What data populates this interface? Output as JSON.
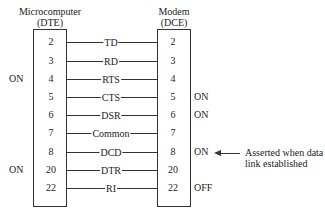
{
  "left_device": {
    "name": "Microcomputer",
    "type": "(DTE)"
  },
  "right_device": {
    "name": "Modem",
    "type": "(DCE)"
  },
  "connections": [
    {
      "left_pin": "2",
      "signal": "TD",
      "right_pin": "2",
      "left_state": "",
      "right_state": ""
    },
    {
      "left_pin": "3",
      "signal": "RD",
      "right_pin": "3",
      "left_state": "",
      "right_state": ""
    },
    {
      "left_pin": "4",
      "signal": "RTS",
      "right_pin": "4",
      "left_state": "ON",
      "right_state": ""
    },
    {
      "left_pin": "5",
      "signal": "CTS",
      "right_pin": "5",
      "left_state": "",
      "right_state": "ON"
    },
    {
      "left_pin": "6",
      "signal": "DSR",
      "right_pin": "6",
      "left_state": "",
      "right_state": "ON"
    },
    {
      "left_pin": "7",
      "signal": "Common",
      "right_pin": "7",
      "left_state": "",
      "right_state": ""
    },
    {
      "left_pin": "8",
      "signal": "DCD",
      "right_pin": "8",
      "left_state": "",
      "right_state": "ON"
    },
    {
      "left_pin": "20",
      "signal": "DTR",
      "right_pin": "20",
      "left_state": "ON",
      "right_state": ""
    },
    {
      "left_pin": "22",
      "signal": "RI",
      "right_pin": "22",
      "left_state": "",
      "right_state": "OFF"
    }
  ],
  "annotation": {
    "line1": "Asserted when data",
    "line2": "link established"
  }
}
